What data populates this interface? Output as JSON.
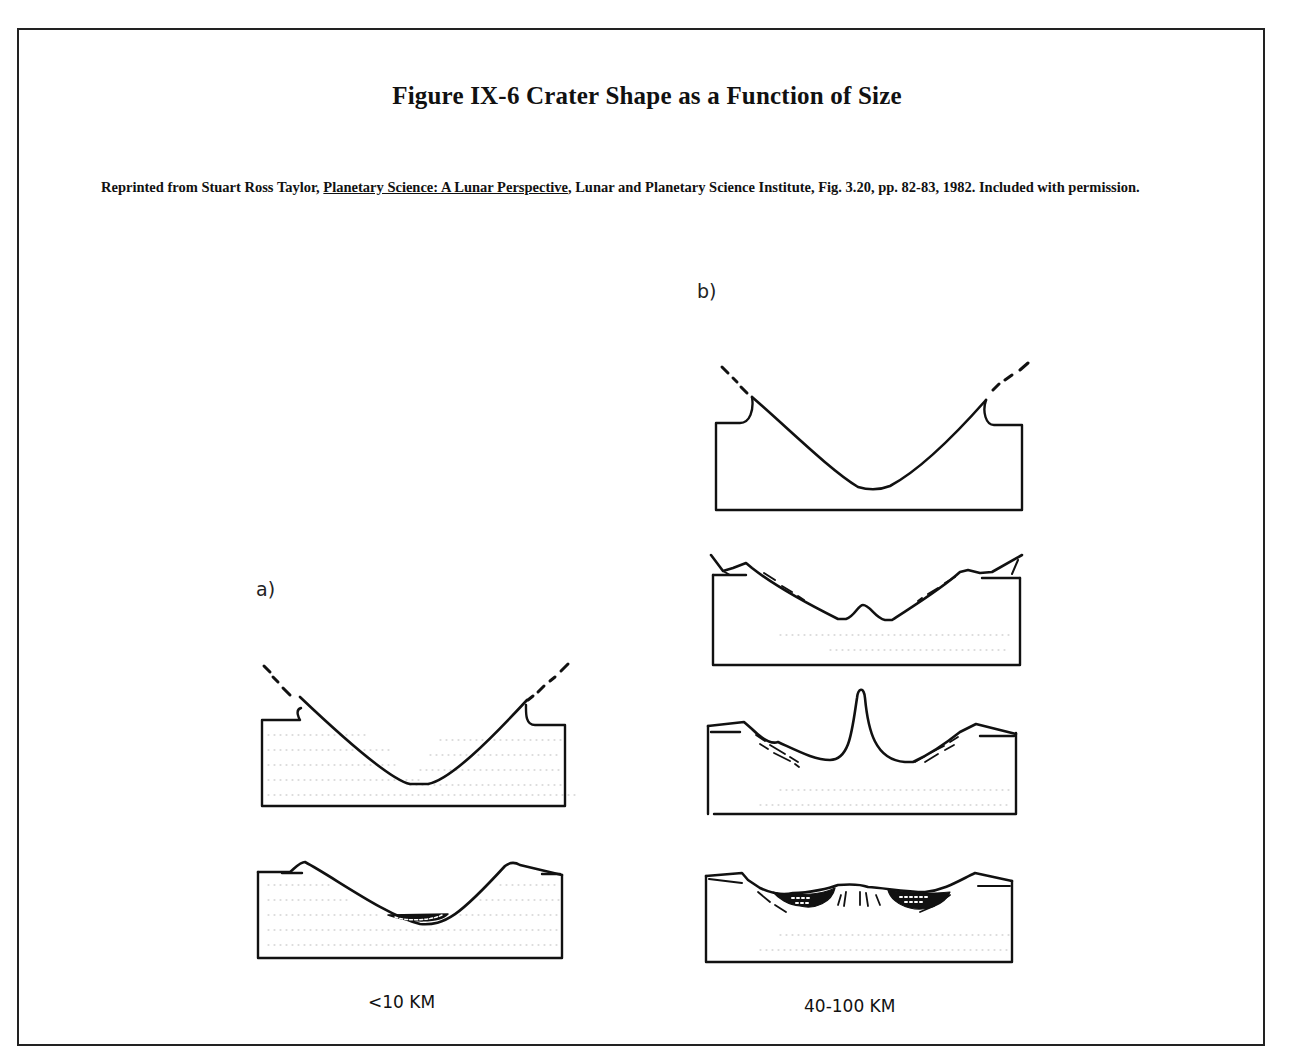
{
  "figure": {
    "title": "Figure IX-6  Crater Shape as a Function of Size",
    "caption": {
      "prefix": "Reprinted from Stuart Ross Taylor, ",
      "book_title": "Planetary Science: A Lunar Perspective",
      "suffix": ", Lunar and Planetary Science Institute, Fig. 3.20, pp. 82-83, 1982. Included with permission."
    }
  },
  "panels": [
    {
      "label": "a)",
      "size_label": "<10 KM",
      "diagrams": [
        {
          "name": "simple-crater-transient",
          "description": "Bowl-shaped transient cavity with ejecta curtain"
        },
        {
          "name": "simple-crater-final",
          "description": "Simple bowl crater with breccia lens floor"
        }
      ]
    },
    {
      "label": "b)",
      "size_label": "40-100 KM",
      "diagrams": [
        {
          "name": "complex-crater-transient",
          "description": "Transient cavity with ejecta curtain"
        },
        {
          "name": "complex-crater-rebound",
          "description": "Floor rebound with slumped walls"
        },
        {
          "name": "complex-crater-central-peak",
          "description": "Central peak uplift with terraced walls"
        },
        {
          "name": "complex-crater-final",
          "description": "Final crater with central peak, terraces and melt/breccia fill"
        }
      ]
    }
  ]
}
